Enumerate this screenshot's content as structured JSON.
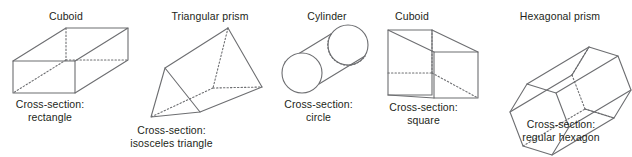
{
  "figure": {
    "background_color": "#ffffff",
    "stroke_color": "#6d6e71",
    "text_color": "#231f20",
    "solid_line_style": "solid",
    "hidden_edge_style": "dotted"
  },
  "shapes": [
    {
      "id": "cuboid-rectangle",
      "title": "Cuboid",
      "cross_section_label": "Cross-section:",
      "cross_section_value": "rectangle",
      "title_x": 66,
      "title_y": 10,
      "caption_x": 49,
      "caption_y": 100
    },
    {
      "id": "triangular-prism",
      "title": "Triangular prism",
      "cross_section_label": "Cross-section:",
      "cross_section_value": "isosceles triangle",
      "title_x": 210,
      "title_y": 10,
      "caption_x": 171,
      "caption_y": 126
    },
    {
      "id": "cylinder",
      "title": "Cylinder",
      "cross_section_label": "Cross-section:",
      "cross_section_value": "circle",
      "title_x": 327,
      "title_y": 10,
      "caption_x": 318,
      "caption_y": 100
    },
    {
      "id": "cuboid-square",
      "title": "Cuboid",
      "cross_section_label": "Cross-section:",
      "cross_section_value": "square",
      "title_x": 412,
      "title_y": 10,
      "caption_x": 423,
      "caption_y": 103
    },
    {
      "id": "hexagonal-prism",
      "title": "Hexagonal prism",
      "cross_section_label": "Cross-section:",
      "cross_section_value": "regular hexagon",
      "title_x": 560,
      "title_y": 10,
      "caption_x": 561,
      "caption_y": 120
    }
  ],
  "geometry": {
    "cuboid_rectangle": {
      "front_face": "13,61 75,61 75,93 13,93",
      "top_face": "13,61 66,28 128,28 75,61",
      "right_face": "75,61 128,28 128,60 75,93",
      "hidden_edges": "66,28 66,60 | 66,60 128,60 | 66,60 13,93"
    },
    "triangular_prism": {
      "front_triangle": "165,68 151,117 200,112",
      "back_apex": "228,28",
      "back_bottom": "262,87",
      "hidden_edges": "228,28 213,88 | 213,88 262,87 | 213,88 151,117"
    },
    "cylinder": {
      "front_circle_center": "302,73",
      "front_circle_r": 20,
      "back_circle_center": "348,45",
      "back_circle_r": 20,
      "hidden_arc": true
    },
    "cuboid_square": {
      "back_face": "388,30 432,30 432,95 388,95",
      "front_face": "434,52 478,52 478,98 434,98",
      "hidden_edges": "432,56 388,56 | 432,56 478,98"
    },
    "hexagonal_prism": {
      "front_hexagon": "523,145 512,110 528,85 555,93 566,128 550,152",
      "offset": "62,-37"
    }
  }
}
